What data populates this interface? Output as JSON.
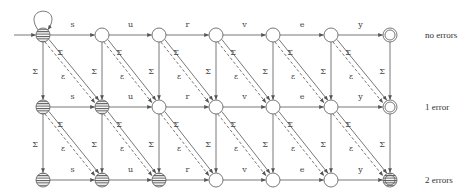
{
  "diagram": {
    "word": [
      "s",
      "u",
      "r",
      "v",
      "e",
      "y"
    ],
    "columns_x": [
      43,
      102,
      159,
      216,
      273,
      331,
      390
    ],
    "rows_y": [
      35,
      107,
      180
    ],
    "row_labels": [
      "no errors",
      "1 error",
      "2 errors"
    ],
    "insertion_label": "Σ",
    "substitution_label": "Σ",
    "deletion_label": "ε",
    "striped_nodes": [
      [
        0,
        0
      ],
      [
        1,
        0
      ],
      [
        1,
        1
      ],
      [
        2,
        0
      ],
      [
        2,
        1
      ],
      [
        2,
        2
      ],
      [
        2,
        6
      ]
    ],
    "accepting_nodes": [
      [
        0,
        6
      ],
      [
        1,
        6
      ],
      [
        2,
        6
      ]
    ],
    "colors": {
      "stroke": "#555555",
      "text": "#444444",
      "background": "#ffffff"
    }
  }
}
